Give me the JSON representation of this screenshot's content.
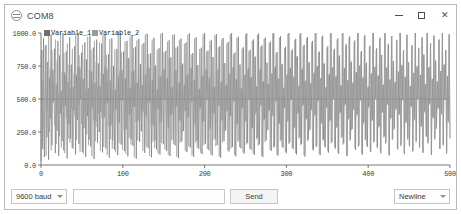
{
  "window": {
    "title": "COM8",
    "icon": "serial-monitor-icon",
    "controls": {
      "minimize": "minimize-icon",
      "maximize": "maximize-icon",
      "close": "✕"
    }
  },
  "bottom_bar": {
    "baud": {
      "selected": "9600 baud",
      "options": [
        "300 baud",
        "1200 baud",
        "2400 baud",
        "4800 baud",
        "9600 baud",
        "19200 baud",
        "38400 baud",
        "57600 baud",
        "115200 baud"
      ]
    },
    "send_input": {
      "value": "",
      "placeholder": ""
    },
    "send_label": "Send",
    "line_ending": {
      "selected": "Newline",
      "options": [
        "No line ending",
        "Newline",
        "Carriage return",
        "Both NL & CR"
      ]
    }
  },
  "chart_data": {
    "type": "line",
    "title": "",
    "xlabel": "",
    "ylabel": "",
    "xlim": [
      0,
      500
    ],
    "ylim": [
      0,
      1000
    ],
    "xticks": [
      0,
      100,
      200,
      300,
      400,
      500
    ],
    "xtick_labels": [
      "0",
      "100",
      "200",
      "300",
      "400",
      "500"
    ],
    "yticks": [
      0,
      250,
      500,
      750,
      1000
    ],
    "ytick_labels": [
      "0.0",
      "250.0",
      "500.0",
      "750.0",
      "1000.0"
    ],
    "grid": false,
    "legend_position": "top-left",
    "colors": {
      "variable_1": "#6e6e6e",
      "variable_2": "#9a9a9a",
      "axis": "#555555",
      "reference_line": "#777777"
    },
    "reference_line_y": 500,
    "series": [
      {
        "name": "Variable_1",
        "color": "#6e6e6e",
        "values": [
          30,
          870,
          120,
          960,
          60,
          540,
          910,
          210,
          780,
          40,
          660,
          350,
          990,
          150,
          720,
          480,
          880,
          90,
          610,
          260,
          940,
          70,
          830,
          390,
          560,
          180,
          1000,
          110,
          700,
          450,
          860,
          50,
          630,
          310,
          970,
          200,
          760,
          130,
          590,
          410,
          900,
          80,
          680,
          340,
          1000,
          160,
          740,
          500,
          850,
          100,
          650,
          280,
          930,
          60,
          800,
          370,
          580,
          190,
          980,
          140,
          710,
          430,
          890,
          45,
          620,
          330,
          950,
          170,
          770,
          250,
          600,
          400,
          920,
          95,
          690,
          360,
          990,
          125,
          730,
          470,
          840,
          55,
          640,
          300,
          960,
          185,
          750,
          115,
          570,
          420,
          880,
          75,
          670,
          320,
          1000,
          155,
          720,
          490,
          860,
          105,
          655,
          270,
          940,
          65,
          810,
          380,
          585,
          195,
          985,
          145,
          715,
          440,
          895,
          48,
          625,
          335,
          955,
          175,
          765,
          255,
          605,
          405,
          925,
          92,
          685,
          365,
          995,
          128,
          735,
          475,
          845,
          58,
          645,
          305,
          965,
          188,
          755,
          118,
          575,
          425,
          885,
          78,
          675,
          325,
          1000,
          158,
          725,
          495,
          865,
          108,
          660,
          275,
          945,
          68,
          815,
          385,
          590,
          198,
          990,
          148,
          718,
          445,
          898,
          52,
          628,
          338,
          958,
          178,
          768,
          258,
          608,
          408,
          928,
          98,
          688,
          368,
          998,
          132,
          738,
          478,
          848,
          62,
          648,
          308,
          968,
          182,
          758,
          122,
          578,
          428,
          888,
          82,
          678,
          328,
          1000,
          162,
          728,
          498,
          868,
          112,
          662,
          278,
          948,
          72,
          818,
          388,
          592,
          202,
          992,
          152,
          722,
          448,
          902,
          56,
          632,
          342,
          962,
          182,
          772,
          262,
          612,
          412,
          932,
          102,
          692,
          372,
          1000,
          136,
          742,
          482,
          852,
          66,
          652,
          312,
          972,
          186,
          762,
          126,
          582,
          432,
          892,
          86,
          682,
          332,
          998,
          166,
          732,
          500,
          872,
          116,
          666,
          282,
          952,
          76,
          822,
          392,
          596,
          206,
          996,
          156,
          726,
          452,
          906,
          60,
          636,
          346,
          966,
          186,
          776,
          266,
          616,
          416,
          936,
          106,
          696,
          376,
          1000,
          140,
          746,
          486,
          856,
          70,
          656,
          316,
          976,
          190,
          766,
          130,
          586,
          436,
          896,
          90,
          686,
          336,
          1000,
          170,
          736,
          498,
          876,
          120,
          670,
          286,
          956,
          80,
          826,
          396,
          600,
          210,
          1000,
          160,
          730,
          456,
          910,
          64,
          640,
          350,
          970,
          190,
          780,
          270,
          620,
          420,
          940,
          110,
          700,
          380,
          1000,
          144,
          750,
          490,
          860,
          74,
          660,
          320,
          980,
          194,
          770,
          134,
          590,
          440,
          900,
          94,
          690,
          340,
          1000,
          174,
          740,
          500,
          880,
          124,
          674,
          290,
          960,
          84,
          830,
          400,
          604,
          214,
          1000,
          164,
          734,
          460,
          914,
          68,
          644,
          354,
          974,
          194,
          784,
          274,
          624,
          424,
          944,
          114,
          704,
          384,
          1000,
          148,
          754,
          494,
          864,
          78,
          664,
          324,
          984,
          198,
          774,
          138,
          594,
          444,
          904,
          98,
          694,
          344,
          1000,
          178,
          744,
          500,
          884,
          128,
          678,
          294,
          964,
          88,
          834,
          404,
          608,
          218,
          1000,
          168,
          738,
          464,
          918,
          72,
          648,
          358,
          978,
          198,
          788,
          278,
          628,
          428,
          948,
          118,
          708,
          388,
          1000,
          152,
          758,
          498,
          868,
          82,
          668,
          328,
          988,
          202,
          778,
          142,
          598,
          448,
          908,
          102,
          698,
          348,
          1000,
          182,
          748,
          500,
          888,
          132,
          682,
          298,
          968,
          92,
          838,
          408,
          612,
          222,
          1000,
          172,
          742,
          468,
          922,
          76,
          652,
          362,
          982,
          202,
          792,
          282,
          632,
          432,
          952,
          122,
          712,
          392,
          1000,
          156,
          762,
          500,
          872,
          86,
          672,
          332,
          992,
          206
        ]
      },
      {
        "name": "Variable_2",
        "color": "#9a9a9a",
        "values": [
          820,
          140,
          640,
          330,
          180,
          900,
          70,
          560,
          410,
          990,
          250,
          730,
          110,
          870,
          470,
          620,
          300,
          950,
          160,
          790,
          380,
          540,
          220,
          1000,
          130,
          700,
          440,
          850,
          90,
          670,
          350,
          920,
          200,
          760,
          170,
          580,
          430,
          880,
          120,
          690,
          370,
          1000,
          190,
          740,
          460,
          830,
          100,
          660,
          310,
          910,
          85,
          800,
          400,
          570,
          230,
          970,
          150,
          720,
          420,
          870,
          65,
          610,
          340,
          940,
          180,
          780,
          290,
          590,
          390,
          930,
          105,
          700,
          355,
          985,
          135,
          745,
          465,
          835,
          75,
          635,
          295,
          955,
          195,
          765,
          125,
          565,
          415,
          875,
          95,
          665,
          315,
          1000,
          165,
          715,
          485,
          855,
          115,
          645,
          265,
          935,
          85,
          805,
          375,
          575,
          205,
          975,
          155,
          705,
          435,
          885,
          58,
          615,
          325,
          945,
          185,
          755,
          245,
          595,
          395,
          915,
          108,
          675,
          355,
          990,
          138,
          725,
          470,
          840,
          68,
          635,
          295,
          950,
          178,
          745,
          128,
          565,
          415,
          875,
          88,
          665,
          315,
          995,
          168,
          715,
          485,
          855,
          118,
          650,
          265,
          935,
          78,
          805,
          375,
          580,
          188,
          985,
          158,
          708,
          435,
          888,
          62,
          618,
          328,
          948,
          168,
          758,
          248,
          598,
          398,
          918,
          108,
          678,
          358,
          988,
          142,
          728,
          468,
          838,
          72,
          638,
          298,
          958,
          172,
          748,
          132,
          568,
          418,
          878,
          92,
          668,
          318,
          990,
          152,
          718,
          488,
          858,
          122,
          652,
          268,
          938,
          82,
          808,
          378,
          582,
          192,
          982,
          142,
          712,
          438,
          892,
          66,
          622,
          332,
          952,
          172,
          762,
          252,
          602,
          402,
          922,
          112,
          682,
          362,
          992,
          126,
          732,
          472,
          842,
          76,
          642,
          302,
          962,
          176,
          752,
          136,
          572,
          422,
          882,
          96,
          672,
          322,
          988,
          156,
          722,
          490,
          862,
          126,
          656,
          272,
          942,
          86,
          812,
          382,
          586,
          196,
          986,
          146,
          716,
          442,
          896,
          70,
          626,
          336,
          956,
          176,
          766,
          256,
          606,
          406,
          926,
          116,
          686,
          366,
          996,
          130,
          736,
          476,
          846,
          80,
          646,
          306,
          966,
          180,
          756,
          140,
          576,
          426,
          886,
          100,
          676,
          326,
          992,
          160,
          726,
          494,
          866,
          130,
          660,
          276,
          946,
          90,
          816,
          386,
          590,
          200,
          990,
          150,
          720,
          446,
          900,
          74,
          630,
          340,
          960,
          180,
          770,
          260,
          610,
          410,
          930,
          120,
          690,
          370,
          1000,
          134,
          740,
          480,
          850,
          84,
          650,
          310,
          970,
          184,
          760,
          144,
          580,
          430,
          890,
          104,
          680,
          330,
          996,
          164,
          730,
          498,
          870,
          134,
          664,
          280,
          950,
          94,
          820,
          390,
          594,
          204,
          994,
          154,
          724,
          450,
          904,
          78,
          634,
          344,
          964,
          184,
          774,
          264,
          614,
          414,
          934,
          124,
          694,
          374,
          1000,
          138,
          744,
          484,
          854,
          88,
          654,
          314,
          974,
          188,
          764,
          148,
          584,
          434,
          894,
          108,
          684,
          334,
          1000,
          168,
          734,
          500,
          874,
          138,
          668,
          284,
          954,
          98,
          824,
          394,
          598,
          208,
          998,
          158,
          728,
          454,
          908,
          82,
          638,
          348,
          968,
          188,
          778,
          268,
          618,
          418,
          938,
          128,
          698,
          378,
          1000,
          142,
          748,
          488,
          858,
          92,
          658,
          318,
          978,
          192,
          768,
          152,
          588,
          438,
          898,
          112,
          688,
          338,
          1000,
          172,
          738,
          500,
          878,
          142,
          672,
          288,
          958,
          102,
          828,
          398,
          602,
          212,
          1000,
          162,
          732,
          458,
          912,
          86,
          642,
          352,
          972,
          192,
          782,
          272,
          622,
          422,
          942,
          132,
          702,
          382,
          1000,
          146,
          752,
          492,
          862,
          96,
          662,
          322,
          982,
          196
        ]
      }
    ]
  }
}
